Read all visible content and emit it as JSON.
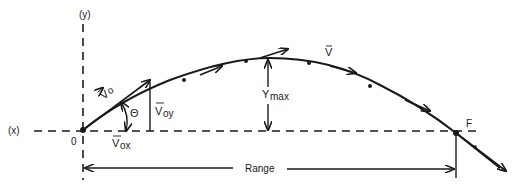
{
  "diagram": {
    "axes": {
      "x_label": "(x)",
      "y_label": "(y)",
      "origin_label": "0"
    },
    "vectors": {
      "initial_velocity": "V",
      "initial_velocity_sub": "o",
      "vertical_component": "V",
      "vertical_component_sub": "oy",
      "horizontal_component": "V",
      "horizontal_component_sub": "ox",
      "velocity": "V"
    },
    "angle_label": "Θ",
    "max_height_label": "Y",
    "max_height_sub": "max",
    "landing_point_label": "F",
    "range_label": "Range"
  },
  "colors": {
    "ink": "#1a1a1a",
    "background": "#ffffff"
  }
}
